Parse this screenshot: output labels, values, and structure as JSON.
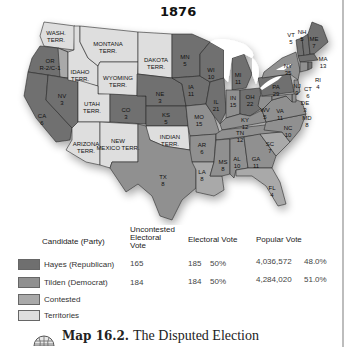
{
  "map": {
    "title": "1876",
    "colors": {
      "hayes": "#6f6f6f",
      "tilden": "#909090",
      "contested": "#a9a9a9",
      "territories": "#dedede",
      "lakes": "#ffffff"
    },
    "regions": [
      {
        "abbr": "WASH.",
        "label2": "TERR.",
        "party": "territories"
      },
      {
        "abbr": "MONTANA",
        "label2": "TERR.",
        "party": "territories"
      },
      {
        "abbr": "DAKOTA",
        "label2": "TERR.",
        "party": "territories"
      },
      {
        "abbr": "IDAHO",
        "label2": "TERR.",
        "party": "territories"
      },
      {
        "abbr": "WYOMING",
        "label2": "TERR.",
        "party": "territories"
      },
      {
        "abbr": "UTAH",
        "label2": "TERR.",
        "party": "territories"
      },
      {
        "abbr": "ARIZONA",
        "label2": "TERR.",
        "party": "territories"
      },
      {
        "abbr": "NEW",
        "label2": "MEXICO TERR.",
        "party": "territories"
      },
      {
        "abbr": "INDIAN",
        "label2": "TERR.",
        "party": "territories"
      },
      {
        "abbr": "OR",
        "label2": "R-2/C-1",
        "party": "hayes"
      },
      {
        "abbr": "CA",
        "label2": "6",
        "party": "hayes"
      },
      {
        "abbr": "NV",
        "label2": "3",
        "party": "hayes"
      },
      {
        "abbr": "CO",
        "label2": "3",
        "party": "hayes"
      },
      {
        "abbr": "NE",
        "label2": "3",
        "party": "hayes"
      },
      {
        "abbr": "KS",
        "label2": "5",
        "party": "hayes"
      },
      {
        "abbr": "TX",
        "label2": "8",
        "party": "tilden"
      },
      {
        "abbr": "MN",
        "label2": "5",
        "party": "hayes"
      },
      {
        "abbr": "IA",
        "label2": "11",
        "party": "hayes"
      },
      {
        "abbr": "MO",
        "label2": "15",
        "party": "tilden"
      },
      {
        "abbr": "AR",
        "label2": "6",
        "party": "tilden"
      },
      {
        "abbr": "LA",
        "label2": "8",
        "party": "contested"
      },
      {
        "abbr": "WI",
        "label2": "10",
        "party": "hayes"
      },
      {
        "abbr": "IL",
        "label2": "21",
        "party": "hayes"
      },
      {
        "abbr": "MI",
        "label2": "11",
        "party": "hayes"
      },
      {
        "abbr": "IN",
        "label2": "15",
        "party": "tilden"
      },
      {
        "abbr": "OH",
        "label2": "22",
        "party": "hayes"
      },
      {
        "abbr": "KY",
        "label2": "12",
        "party": "tilden"
      },
      {
        "abbr": "TN",
        "label2": "12",
        "party": "tilden"
      },
      {
        "abbr": "MS",
        "label2": "8",
        "party": "tilden"
      },
      {
        "abbr": "AL",
        "label2": "10",
        "party": "tilden"
      },
      {
        "abbr": "GA",
        "label2": "11",
        "party": "tilden"
      },
      {
        "abbr": "FL",
        "label2": "4",
        "party": "contested"
      },
      {
        "abbr": "SC",
        "label2": "7",
        "party": "contested"
      },
      {
        "abbr": "NC",
        "label2": "10",
        "party": "tilden"
      },
      {
        "abbr": "VA",
        "label2": "11",
        "party": "tilden"
      },
      {
        "abbr": "WV",
        "label2": "5",
        "party": "tilden"
      },
      {
        "abbr": "PA",
        "label2": "29",
        "party": "hayes"
      },
      {
        "abbr": "NY",
        "label2": "35",
        "party": "tilden"
      },
      {
        "abbr": "VT",
        "label2": "5",
        "party": "hayes"
      },
      {
        "abbr": "NH",
        "label2": "5",
        "party": "hayes"
      },
      {
        "abbr": "ME",
        "label2": "7",
        "party": "hayes"
      },
      {
        "abbr": "MA",
        "label2": "13",
        "party": "hayes"
      },
      {
        "abbr": "RI",
        "label2": "4",
        "party": "hayes"
      },
      {
        "abbr": "CT",
        "label2": "6",
        "party": "tilden"
      },
      {
        "abbr": "NJ",
        "label2": "9",
        "party": "tilden"
      },
      {
        "abbr": "DE",
        "label2": "3",
        "party": "tilden"
      },
      {
        "abbr": "MD",
        "label2": "8",
        "party": "tilden"
      }
    ]
  },
  "legend": {
    "headers": {
      "candidate": "Candidate (Party)",
      "uncontested_l1": "Uncontested",
      "uncontested_l2": "Electoral",
      "uncontested_l3": "Vote",
      "electoral": "Electoral Vote",
      "popular": "Popular Vote"
    },
    "rows": [
      {
        "label": "Hayes (Republican)",
        "uncontested": "165",
        "electoral": "185",
        "electoral_pct": "50%",
        "popular": "4,036,572",
        "popular_pct": "48.0%"
      },
      {
        "label": "Tilden (Democrat)",
        "uncontested": "184",
        "electoral": "184",
        "electoral_pct": "50%",
        "popular": "4,284,020",
        "popular_pct": "51.0%"
      },
      {
        "label": "Contested"
      },
      {
        "label": "Territories"
      }
    ]
  },
  "caption": {
    "icon": "globe-icon",
    "number": "Map 16.2.",
    "title": "The Disputed Election"
  }
}
